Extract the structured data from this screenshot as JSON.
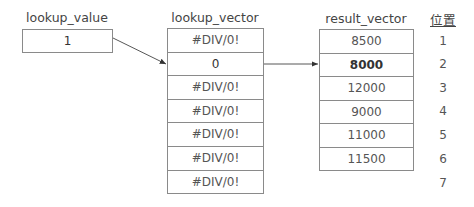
{
  "lookup_value": {
    "title": "lookup_value",
    "value": "1"
  },
  "lookup_vector": {
    "title": "lookup_vector",
    "cells": [
      "#DIV/0!",
      "0",
      "#DIV/0!",
      "#DIV/0!",
      "#DIV/0!",
      "#DIV/0!",
      "#DIV/0!"
    ],
    "matched_index": 1
  },
  "result_vector": {
    "title": "result_vector",
    "cells": [
      "8500",
      "8000",
      "12000",
      "9000",
      "11000",
      "11500"
    ],
    "matched_index": 1
  },
  "position": {
    "title": "位置",
    "numbers": [
      "1",
      "2",
      "3",
      "4",
      "5",
      "6",
      "7"
    ]
  }
}
